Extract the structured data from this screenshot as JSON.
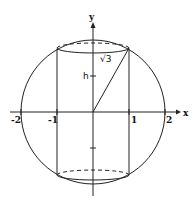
{
  "figure": {
    "axes": {
      "x_label": "x",
      "y_label": "y",
      "x_ticks": [
        "-2",
        "-1",
        "1",
        "2"
      ]
    },
    "labels": {
      "height": "h",
      "half_diagonal": "√3"
    },
    "geometry": {
      "sphere_radius": 2,
      "cylinder_radius": 1,
      "cylinder_half_height": "√3"
    },
    "colors": {
      "stroke": "#222222",
      "background": "#ffffff"
    }
  }
}
